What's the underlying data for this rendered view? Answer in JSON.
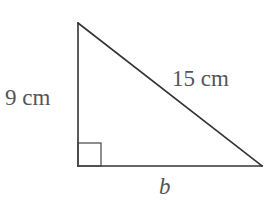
{
  "diagram": {
    "type": "right-triangle",
    "vertices": {
      "top": [
        78,
        23
      ],
      "right_angle": [
        78,
        166
      ],
      "right": [
        262,
        166
      ]
    },
    "right_angle_marker": {
      "x": 78,
      "y": 143,
      "size": 23
    },
    "labels": {
      "vertical_leg": "9 cm",
      "hypotenuse": "15 cm",
      "base": "b"
    },
    "colors": {
      "line": "#333333",
      "text": "#555555",
      "background": "#ffffff"
    }
  }
}
